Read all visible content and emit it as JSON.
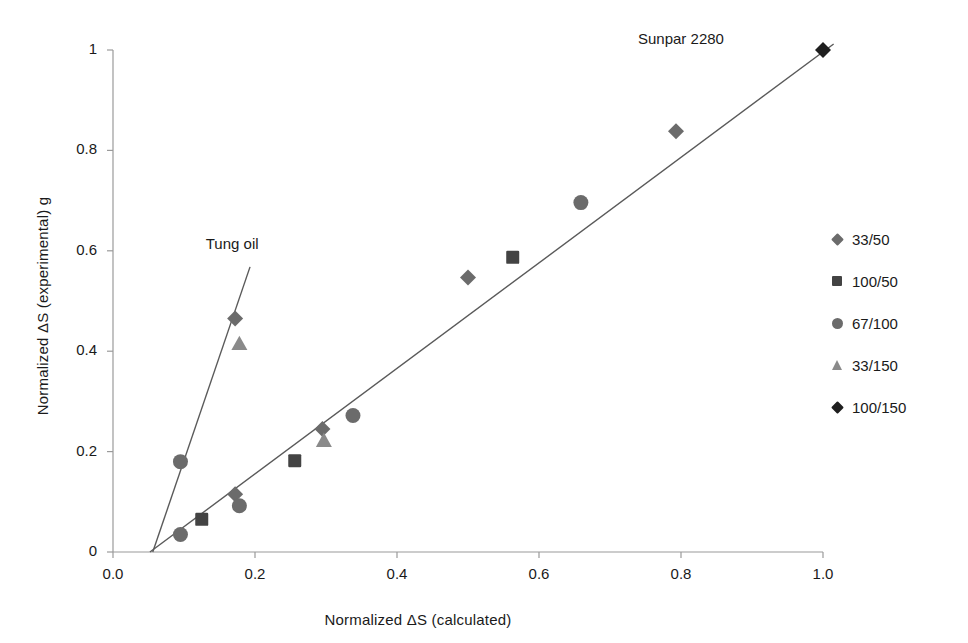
{
  "chart_data": {
    "type": "scatter",
    "title": "",
    "xlabel": "Normalized ΔS (calculated)",
    "ylabel": "Normalized ΔS (experimental) g",
    "xlim": [
      0.0,
      1.0
    ],
    "ylim": [
      0,
      1
    ],
    "xticks": [
      "0.0",
      "0.2",
      "0.4",
      "0.6",
      "0.8",
      "1.0"
    ],
    "xtick_values": [
      0.0,
      0.2,
      0.4,
      0.6,
      0.8,
      1.0
    ],
    "yticks": [
      "0",
      "0.2",
      "0.4",
      "0.6",
      "0.8",
      "1"
    ],
    "ytick_values": [
      0,
      0.2,
      0.4,
      0.6,
      0.8,
      1.0
    ],
    "grid": false,
    "legend_position": "right",
    "legend": [
      {
        "name": "33/50",
        "marker": "diamond",
        "color": "#6b6b6b"
      },
      {
        "name": "100/50",
        "marker": "square",
        "color": "#434343"
      },
      {
        "name": "67/100",
        "marker": "circle",
        "color": "#6b6b6b"
      },
      {
        "name": "33/150",
        "marker": "triangle",
        "color": "#8a8a8a"
      },
      {
        "name": "100/150",
        "marker": "diamond",
        "color": "#1f1f1f"
      }
    ],
    "series": [
      {
        "name": "33/50",
        "marker": "diamond",
        "color": "#6b6b6b",
        "points": [
          {
            "x": 0.172,
            "y": 0.465
          },
          {
            "x": 0.172,
            "y": 0.115
          },
          {
            "x": 0.295,
            "y": 0.245
          },
          {
            "x": 0.5,
            "y": 0.547
          },
          {
            "x": 0.793,
            "y": 0.838
          }
        ]
      },
      {
        "name": "100/50",
        "marker": "square",
        "color": "#434343",
        "points": [
          {
            "x": 0.125,
            "y": 0.065
          },
          {
            "x": 0.256,
            "y": 0.182
          },
          {
            "x": 0.563,
            "y": 0.587
          }
        ]
      },
      {
        "name": "67/100",
        "marker": "circle",
        "color": "#6b6b6b",
        "points": [
          {
            "x": 0.095,
            "y": 0.18
          },
          {
            "x": 0.095,
            "y": 0.035
          },
          {
            "x": 0.178,
            "y": 0.092
          },
          {
            "x": 0.338,
            "y": 0.272
          },
          {
            "x": 0.659,
            "y": 0.696
          }
        ]
      },
      {
        "name": "33/150",
        "marker": "triangle",
        "color": "#8a8a8a",
        "points": [
          {
            "x": 0.178,
            "y": 0.415
          },
          {
            "x": 0.297,
            "y": 0.222
          }
        ]
      },
      {
        "name": "100/150",
        "marker": "diamond",
        "color": "#1f1f1f",
        "points": [
          {
            "x": 1.0,
            "y": 1.0
          }
        ]
      }
    ],
    "trend_lines": [
      {
        "name": "Sunpar 2280",
        "x1": 0.052,
        "y1": 0.0,
        "x2": 1.015,
        "y2": 1.012,
        "color": "#5a5a5a"
      },
      {
        "name": "Tung oil",
        "x1": 0.056,
        "y1": 0.0,
        "x2": 0.193,
        "y2": 0.568,
        "color": "#5a5a5a"
      }
    ],
    "annotations": [
      {
        "text": "Sunpar 2280",
        "x": 0.8,
        "y": 1.02
      },
      {
        "text": "Tung oil",
        "x": 0.168,
        "y": 0.612
      }
    ]
  },
  "axes": {
    "axis_color": "#9a9a9a",
    "text_color": "#1a1a1a",
    "background": "#ffffff"
  }
}
